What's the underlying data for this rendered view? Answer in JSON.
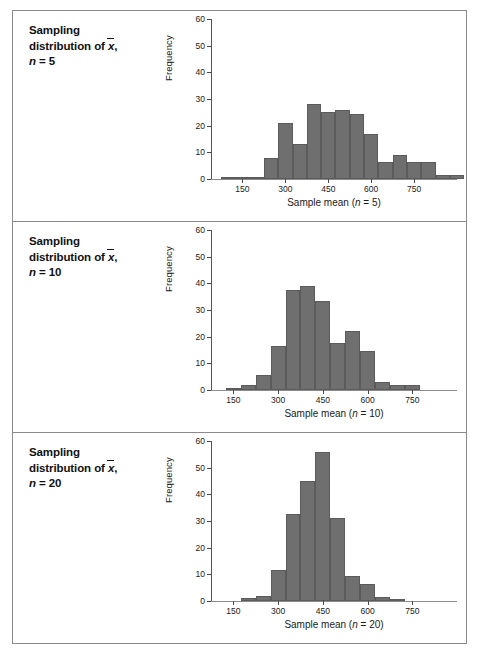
{
  "figure": {
    "border_color": "#8a8a8a",
    "bar_color": "#6f6f6f",
    "bar_border_color": "#5b5b5b"
  },
  "panels": [
    {
      "id": "panel-n5",
      "title_line1": "Sampling",
      "title_line2_prefix": "distribution of ",
      "title_line2_xbar": "x",
      "title_line2_suffix": ",",
      "title_line3_var": "n",
      "title_line3_rest": " = 5",
      "chart_data": {
        "type": "bar",
        "title": "Sampling distribution of x̄, n = 5",
        "xlabel": "Sample mean (n = 5)",
        "ylabel": "Frequency",
        "ylim": [
          0,
          60
        ],
        "yticks": [
          0,
          10,
          20,
          30,
          40,
          50,
          60
        ],
        "xlim": [
          40,
          900
        ],
        "xticks": [
          150,
          300,
          450,
          600,
          750
        ],
        "grid": false,
        "legend": "none",
        "bin_width": 50,
        "bin_starts": [
          75,
          125,
          175,
          225,
          275,
          325,
          375,
          425,
          475,
          525,
          575,
          625,
          675,
          725,
          775,
          825,
          875
        ],
        "categories": [
          "75-125",
          "125-175",
          "175-225",
          "225-275",
          "275-325",
          "325-375",
          "375-425",
          "425-475",
          "475-525",
          "525-575",
          "575-625",
          "625-675",
          "675-725",
          "725-775",
          "775-825",
          "825-875",
          "875-925"
        ],
        "values": [
          0.5,
          0.5,
          0.5,
          8,
          21,
          13,
          28,
          25,
          26,
          24.5,
          17,
          6.5,
          9,
          6.5,
          6.5,
          1.5,
          1.5
        ]
      }
    },
    {
      "id": "panel-n10",
      "title_line1": "Sampling",
      "title_line2_prefix": "distribution of ",
      "title_line2_xbar": "x",
      "title_line2_suffix": ",",
      "title_line3_var": "n",
      "title_line3_rest": " = 10",
      "chart_data": {
        "type": "bar",
        "title": "Sampling distribution of x̄, n = 10",
        "xlabel": "Sample mean (n = 10)",
        "ylabel": "Frequency",
        "ylim": [
          0,
          60
        ],
        "yticks": [
          0,
          10,
          20,
          30,
          40,
          50,
          60
        ],
        "xlim": [
          75,
          900
        ],
        "xticks": [
          150,
          300,
          450,
          600,
          750
        ],
        "grid": false,
        "legend": "none",
        "bin_width": 50,
        "bin_starts": [
          125,
          175,
          225,
          275,
          325,
          375,
          425,
          475,
          525,
          575,
          625,
          675,
          725
        ],
        "categories": [
          "125-175",
          "175-225",
          "225-275",
          "275-325",
          "325-375",
          "375-425",
          "425-475",
          "475-525",
          "525-575",
          "575-625",
          "625-675",
          "675-725",
          "725-775"
        ],
        "values": [
          0.5,
          2,
          5.5,
          16.5,
          37.5,
          39,
          33.5,
          17.5,
          22,
          14.5,
          3,
          2,
          2
        ]
      }
    },
    {
      "id": "panel-n20",
      "title_line1": "Sampling",
      "title_line2_prefix": "distribution of ",
      "title_line2_xbar": "x",
      "title_line2_suffix": ",",
      "title_line3_var": "n",
      "title_line3_rest": " = 20",
      "chart_data": {
        "type": "bar",
        "title": "Sampling distribution of x̄, n = 20",
        "xlabel": "Sample mean (n = 20)",
        "ylabel": "Frequency",
        "ylim": [
          0,
          60
        ],
        "yticks": [
          0,
          10,
          20,
          30,
          40,
          50,
          60
        ],
        "xlim": [
          75,
          900
        ],
        "xticks": [
          150,
          300,
          450,
          600,
          750
        ],
        "grid": false,
        "legend": "none",
        "bin_width": 50,
        "bin_starts": [
          175,
          225,
          275,
          325,
          375,
          425,
          475,
          525,
          575,
          625,
          675
        ],
        "categories": [
          "175-225",
          "225-275",
          "275-325",
          "325-375",
          "375-425",
          "425-475",
          "475-525",
          "525-575",
          "575-625",
          "625-675",
          "675-725"
        ],
        "values": [
          1,
          2,
          11.5,
          32.5,
          45,
          56,
          31,
          9.5,
          6.5,
          1.5,
          0.5
        ]
      }
    }
  ],
  "caption": ""
}
